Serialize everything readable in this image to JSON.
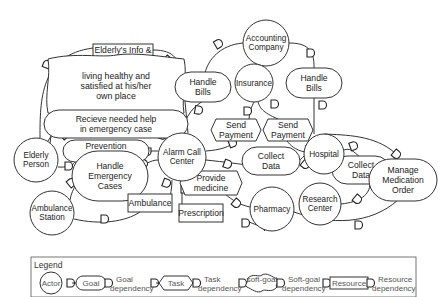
{
  "diagram": {
    "nodes": [
      {
        "id": "elderly_info",
        "type": "resource",
        "label": [
          "Elderly's Info &",
          "Vital signs"
        ],
        "x": 123,
        "y": 55,
        "w": 60,
        "h": 22
      },
      {
        "id": "living_healthy",
        "type": "softgoal",
        "label": [
          "living healthy and",
          "satisfied at his/her",
          "own place"
        ],
        "x": 116,
        "y": 86,
        "w": 68,
        "h": 31
      },
      {
        "id": "receive_help",
        "type": "goal",
        "label": [
          "Recieve needed help",
          "in emergency case"
        ],
        "x": 116,
        "y": 124,
        "w": 60,
        "h": 13
      },
      {
        "id": "prevention",
        "type": "goal",
        "label": [
          "Prevention",
          "of incidents"
        ],
        "x": 106,
        "y": 151,
        "w": 31,
        "h": 10
      },
      {
        "id": "handle_emergency",
        "type": "goal",
        "label": [
          "Handle",
          "Emergency",
          "Cases"
        ],
        "x": 110,
        "y": 176,
        "w": 26,
        "h": 24
      },
      {
        "id": "ambulance",
        "type": "resource",
        "label": [
          "Ambulance"
        ],
        "x": 150,
        "y": 203,
        "w": 44,
        "h": 18
      },
      {
        "id": "prescription",
        "type": "resource",
        "label": [
          "Prescription"
        ],
        "x": 201,
        "y": 213,
        "w": 44,
        "h": 18
      },
      {
        "id": "handle_bills_1",
        "type": "goal",
        "label": [
          "Handle",
          "Bills"
        ],
        "x": 203,
        "y": 87,
        "w": 16,
        "h": 14
      },
      {
        "id": "send_payment_1",
        "type": "task",
        "label": [
          "Send",
          "Payment"
        ],
        "x": 236,
        "y": 130,
        "w": 20,
        "h": 11
      },
      {
        "id": "send_payment_2",
        "type": "task",
        "label": [
          "Send",
          "Payment"
        ],
        "x": 288,
        "y": 130,
        "w": 20,
        "h": 11
      },
      {
        "id": "handle_bills_2",
        "type": "goal",
        "label": [
          "Handle",
          "Bills"
        ],
        "x": 314,
        "y": 83,
        "w": 16,
        "h": 14
      },
      {
        "id": "collect_data_1",
        "type": "goal",
        "label": [
          "Collect",
          "Data"
        ],
        "x": 271,
        "y": 161,
        "w": 17,
        "h": 13
      },
      {
        "id": "provide_medicine",
        "type": "task",
        "label": [
          "Provide",
          "medicine"
        ],
        "x": 211,
        "y": 183,
        "w": 26,
        "h": 12
      },
      {
        "id": "collect_data_2",
        "type": "goal",
        "label": [
          "Collect",
          "Data"
        ],
        "x": 361,
        "y": 170,
        "w": 17,
        "h": 13
      },
      {
        "id": "manage_med",
        "type": "goal",
        "label": [
          "Manage",
          "Medication",
          "Order"
        ],
        "x": 403,
        "y": 180,
        "w": 22,
        "h": 20
      },
      {
        "id": "accounting",
        "type": "actor",
        "label": [
          "Accounting",
          "Company"
        ],
        "x": 266,
        "y": 43,
        "r": 23
      },
      {
        "id": "insurance",
        "type": "actor",
        "label": [
          "Insurance"
        ],
        "x": 254,
        "y": 83,
        "r": 19
      },
      {
        "id": "alarm_center",
        "type": "actor",
        "label": [
          "Alarm Call",
          "Center"
        ],
        "x": 182,
        "y": 157,
        "r": 24
      },
      {
        "id": "elderly_person",
        "type": "actor",
        "label": [
          "Elderly",
          "Person"
        ],
        "x": 36,
        "y": 160,
        "r": 22
      },
      {
        "id": "ambulance_station",
        "type": "actor",
        "label": [
          "Ambulance",
          "Station"
        ],
        "x": 52,
        "y": 213,
        "r": 22
      },
      {
        "id": "hospital",
        "type": "actor",
        "label": [
          "Hospital"
        ],
        "x": 324,
        "y": 154,
        "r": 20
      },
      {
        "id": "research_center",
        "type": "actor",
        "label": [
          "Research",
          "Center"
        ],
        "x": 320,
        "y": 204,
        "r": 21
      },
      {
        "id": "pharmacy",
        "type": "actor",
        "label": [
          "Pharmacy"
        ],
        "x": 272,
        "y": 209,
        "r": 22
      }
    ],
    "edges": [
      {
        "d": "M40 138 C40 100 40 55 93 48",
        "mx": 47,
        "my": 65,
        "a": -70
      },
      {
        "d": "M153 50 C175 50 180 60 183 80 L188 133",
        "mx": 167,
        "my": 60,
        "a": 40
      },
      {
        "d": "M50 143 C55 110 58 90 82 86",
        "mx": 57,
        "my": 98,
        "a": -80
      },
      {
        "d": "M152 92 C172 96 178 110 180 133",
        "mx": 174,
        "my": 107,
        "a": 40
      },
      {
        "d": "M48 141 C56 130 52 124 56 124",
        "mx": 64,
        "my": 135,
        "a": -40
      },
      {
        "d": "M166 131 C170 134 172 136 172 137",
        "mx": 162,
        "my": 135,
        "a": 20
      },
      {
        "d": "M58 167 C75 168 75 161 78 158",
        "mx": 68,
        "my": 166,
        "a": 0
      },
      {
        "d": "M137 151 L158 151",
        "mx": 147,
        "my": 151,
        "a": 90
      },
      {
        "d": "M70 200 C72 188 80 178 84 176",
        "mx": 71,
        "my": 183,
        "a": -40
      },
      {
        "d": "M135 170 C145 165 150 160 158 160",
        "mx": 143,
        "my": 164,
        "a": -40
      },
      {
        "d": "M74 219 C100 225 125 222 140 212",
        "mx": 104,
        "my": 219,
        "a": 0
      },
      {
        "d": "M172 180 C172 188 170 195 170 203",
        "mx": 166,
        "my": 183,
        "a": 20
      },
      {
        "d": "M182 181 L182 213",
        "mx": 184,
        "my": 189,
        "a": 0
      },
      {
        "d": "M182 133 C185 115 195 105 205 100",
        "mx": 198,
        "my": 110,
        "a": 10
      },
      {
        "d": "M205 73 C208 60 220 45 243 43",
        "mx": 218,
        "my": 44,
        "a": -30
      },
      {
        "d": "M289 43 C305 43 315 48 314 69",
        "mx": 310,
        "my": 53,
        "a": 0
      },
      {
        "d": "M314 97 L314 134",
        "mx": 322,
        "my": 105,
        "a": 0
      },
      {
        "d": "M254 102 C252 106 250 110 249 119",
        "mx": 247,
        "my": 111,
        "a": 0
      },
      {
        "d": "M258 102 C260 108 262 112 278 119",
        "mx": 274,
        "my": 104,
        "a": 0
      },
      {
        "d": "M206 151 C220 150 230 147 236 141",
        "mx": 232,
        "my": 143,
        "a": -20
      },
      {
        "d": "M287 141 C290 145 295 150 305 152",
        "mx": 310,
        "my": 148,
        "a": -30
      },
      {
        "d": "M206 160 C225 162 240 164 254 166",
        "mx": 227,
        "my": 164,
        "a": 20
      },
      {
        "d": "M288 166 C295 166 300 160 304 156",
        "mx": 305,
        "my": 164,
        "a": 40
      },
      {
        "d": "M344 150 C350 148 352 150 361 158",
        "mx": 353,
        "my": 146,
        "a": -20
      },
      {
        "d": "M370 183 C370 195 360 202 341 204",
        "mx": 357,
        "my": 199,
        "a": 40
      },
      {
        "d": "M324 134 C345 135 375 135 395 153",
        "mx": 396,
        "my": 154,
        "a": 40
      },
      {
        "d": "M294 212 C330 225 370 225 398 200",
        "mx": 358,
        "my": 225,
        "a": 0
      },
      {
        "d": "M198 174 C210 180 212 185 214 194",
        "mx": 206,
        "my": 180,
        "a": 40
      },
      {
        "d": "M225 194 C232 200 240 205 250 207",
        "mx": 236,
        "my": 203,
        "a": 40
      },
      {
        "d": "M245 220 C255 225 260 225 265 231",
        "mx": 245,
        "my": 223,
        "a": 0
      }
    ]
  },
  "legend": {
    "title": "Legend",
    "items": [
      {
        "shape": "actor",
        "label": "Actor"
      },
      {
        "shape": "goal",
        "label": "Goal"
      },
      {
        "shape": "dep",
        "label": [
          "Goal",
          "dependency"
        ]
      },
      {
        "shape": "task",
        "label": "Task"
      },
      {
        "shape": "dep",
        "label": [
          "Task",
          "dependency"
        ]
      },
      {
        "shape": "softgoal",
        "label": "soft-goal"
      },
      {
        "shape": "dep",
        "label": [
          "Soft-goal",
          "dependency"
        ]
      },
      {
        "shape": "resource",
        "label": "Resource"
      },
      {
        "shape": "dep",
        "label": [
          "Resource",
          "dependency"
        ]
      }
    ]
  }
}
